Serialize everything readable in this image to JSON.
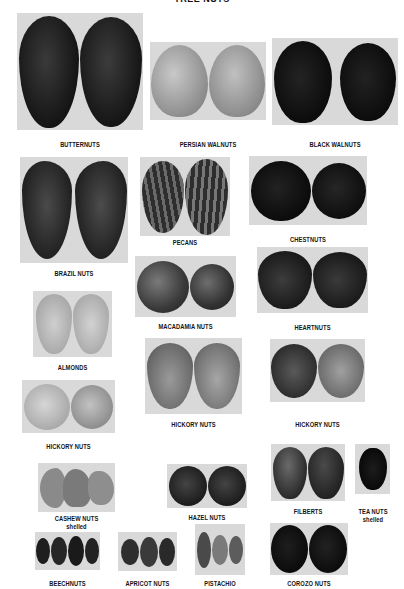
{
  "title": "TREE NUTS",
  "colors": {
    "page_background": "#ffffff",
    "photo_background": "#d9d9d9",
    "label_text": "#141414"
  },
  "nuts": [
    {
      "id": "butternuts",
      "label": "BUTTERNUTS",
      "sublabel": ""
    },
    {
      "id": "persian-walnuts",
      "label": "PERSIAN WALNUTS",
      "sublabel": ""
    },
    {
      "id": "black-walnuts",
      "label": "BLACK WALNUTS",
      "sublabel": ""
    },
    {
      "id": "brazil-nuts",
      "label": "BRAZIL NUTS",
      "sublabel": ""
    },
    {
      "id": "pecans",
      "label": "PECANS",
      "sublabel": ""
    },
    {
      "id": "chestnuts",
      "label": "CHESTNUTS",
      "sublabel": ""
    },
    {
      "id": "macadamia-nuts",
      "label": "MACADAMIA NUTS",
      "sublabel": ""
    },
    {
      "id": "heartnuts",
      "label": "HEARTNUTS",
      "sublabel": ""
    },
    {
      "id": "almonds",
      "label": "ALMONDS",
      "sublabel": ""
    },
    {
      "id": "hickory-nuts-left",
      "label": "HICKORY NUTS",
      "sublabel": ""
    },
    {
      "id": "hickory-nuts-center",
      "label": "HICKORY NUTS",
      "sublabel": ""
    },
    {
      "id": "hickory-nuts-right",
      "label": "HICKORY NUTS",
      "sublabel": ""
    },
    {
      "id": "cashew-nuts",
      "label": "CASHEW NUTS",
      "sublabel": "shelled"
    },
    {
      "id": "hazel-nuts",
      "label": "HAZEL NUTS",
      "sublabel": ""
    },
    {
      "id": "filberts",
      "label": "FILBERTS",
      "sublabel": ""
    },
    {
      "id": "tea-nuts",
      "label": "TEA NUTS",
      "sublabel": "shelled"
    },
    {
      "id": "beechnuts",
      "label": "BEECHNUTS",
      "sublabel": ""
    },
    {
      "id": "apricot-nuts",
      "label": "APRICOT NUTS",
      "sublabel": ""
    },
    {
      "id": "pistachio",
      "label": "PISTACHIO",
      "sublabel": ""
    },
    {
      "id": "corozo-nuts",
      "label": "COROZO NUTS",
      "sublabel": ""
    }
  ]
}
